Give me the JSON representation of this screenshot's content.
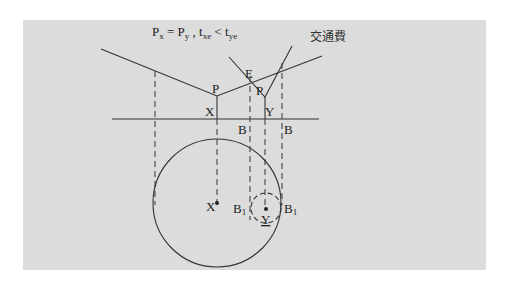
{
  "title": {
    "p_x": "P",
    "sub_x": "x",
    "eq1": " = P",
    "sub_y": "y",
    "sep": " , t",
    "sub_xe": "xe",
    "lt": " < t",
    "sub_ye": "ye"
  },
  "curve_label": "交通費",
  "labels": {
    "e": "E",
    "p_left": "P",
    "p_right": "P",
    "x_axis": "X",
    "y_axis": "Y",
    "b_left": "B",
    "b_right": "B",
    "x_center": "X",
    "y_center": "Y",
    "b1_left": "B",
    "b1_left_sub": "1",
    "b1_right": "B",
    "b1_right_sub": "1"
  },
  "colors": {
    "panel": "#dcdcdc",
    "line": "#333333"
  }
}
